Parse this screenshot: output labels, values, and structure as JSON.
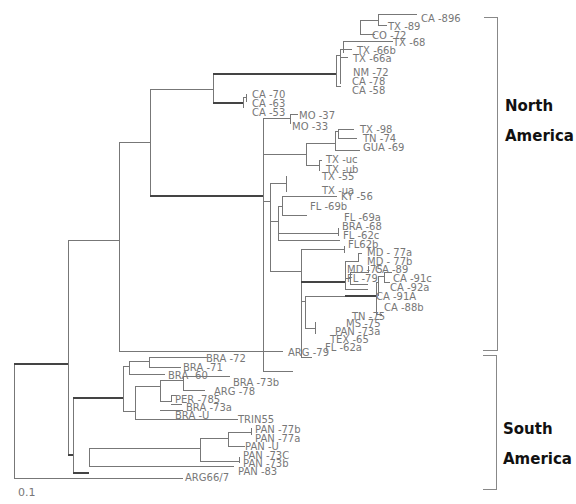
{
  "figure": {
    "type": "phylogenetic-tree",
    "scale_bar_label": "0.1",
    "regions": [
      {
        "name": "North America",
        "line1": "North",
        "line2": "America"
      },
      {
        "name": "South America",
        "line1": "South",
        "line2": "America"
      }
    ],
    "leaves": {
      "ca_896": "CA   -896",
      "tx_89": "TX   -89",
      "co_72": "CO   -72",
      "tx_68": "TX   -68",
      "tx_66b": "TX   -66b",
      "tx_66a": "TX   -66a",
      "nm_72": "NM  -72",
      "ca_78": "CA   -78",
      "ca_58": "CA   -58",
      "ca_70": "CA   -70",
      "ca_63": "CA   -63",
      "ca_53": "CA   -53",
      "mo_37": "MO   -37",
      "mo_33": "MO   -33",
      "tx_98": "TX   -98",
      "tn_74": "TN   -74",
      "gua_69": "GUA   -69",
      "tx_uc": "TX  -uc",
      "tx_ub": "TX  -ub",
      "tx_55": "TX  -55",
      "tx_ua": "TX  -ua",
      "ky_56": "KY  -56",
      "fl_69b": "FL  -69b",
      "fl_69a": "FL  -69a",
      "bra_68": "BRA   -68",
      "fl_62c": "FL  -62c",
      "fl62b": "FL62b",
      "md_77a": "MD  - 77a",
      "md_77b": "MD  - 77b",
      "md_75": "MD  -75",
      "fl_79": "FL  -79",
      "ca_89": "CA  -89",
      "ca_91c": "CA  -91c",
      "ca_92a": "CA  -92a",
      "ca_91A": "CA  -91A",
      "ca_88b": "CA  -88b",
      "tn_75": "TN  -75",
      "ms_75": "MS  -75",
      "pan_73a": "PAN   -73a",
      "tex_65": "TEX   -65",
      "fl_62a": "FL  -62a",
      "arg_79": "ARG   -79",
      "bra_72": "BRA   -72",
      "bra_71": "BRA   -71",
      "bra_60": "BRA   -60",
      "bra_73b": "BRA   -73b",
      "arg_78": "ARG   -78",
      "per_785": "PER   -785",
      "bra_73a": "BRA   -73a",
      "bra_u": "BRA   -U",
      "trin55": "TRIN55",
      "pan_77b": "PAN   -77b",
      "pan_77a": "PAN   -77a",
      "pan_u": "PAN   -U",
      "pan_73c": "PAN   -73C",
      "pan_73b": "PAN   -73b",
      "pan_83": "PAN   -83",
      "arg66_7": "ARG66/7"
    }
  }
}
